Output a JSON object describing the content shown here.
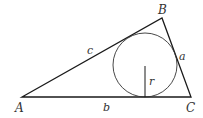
{
  "diagram": {
    "colors": {
      "stroke": "#1a1a1a",
      "text": "#333333",
      "background": "#ffffff"
    },
    "vertices": [
      {
        "id": "A",
        "label": "A",
        "x": 22,
        "y": 97
      },
      {
        "id": "B",
        "label": "B",
        "x": 162,
        "y": 18
      },
      {
        "id": "C",
        "label": "C",
        "x": 191,
        "y": 97
      }
    ],
    "sides": [
      {
        "id": "a",
        "label": "a",
        "from": "B",
        "to": "C"
      },
      {
        "id": "b",
        "label": "b",
        "from": "A",
        "to": "C"
      },
      {
        "id": "c",
        "label": "c",
        "from": "A",
        "to": "B"
      }
    ],
    "incircle": {
      "cx": 145,
      "cy": 65,
      "r": 32,
      "radius_label": "r"
    }
  }
}
